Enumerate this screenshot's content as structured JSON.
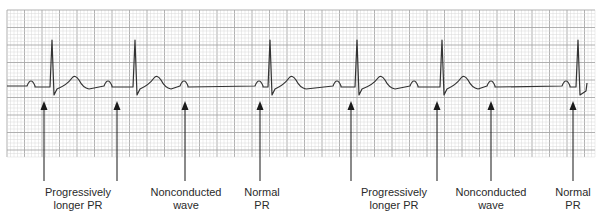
{
  "figure": {
    "type": "ecg-rhythm-strip",
    "grid": {
      "left": 7,
      "top": 10,
      "right": 595,
      "bottom": 157,
      "minor_step": 3.5,
      "major_step": 17.5,
      "minor_color": "#d9d9d9",
      "major_color": "#a8a8a8"
    },
    "trace_color": "#333333",
    "baseline_y": 86,
    "beats": [
      {
        "p_x": 31,
        "qrs_x": 52,
        "t_x": 75,
        "conducted": true
      },
      {
        "p_x": 108,
        "qrs_x": 135,
        "t_x": 157,
        "conducted": true
      },
      {
        "p_x": 184,
        "conducted": false
      },
      {
        "p_x": 259,
        "qrs_x": 270,
        "t_x": 292,
        "conducted": true
      },
      {
        "p_x": 337,
        "qrs_x": 357,
        "t_x": 381,
        "conducted": true
      },
      {
        "p_x": 414,
        "qrs_x": 442,
        "t_x": 464,
        "conducted": true
      },
      {
        "p_x": 491,
        "conducted": false
      },
      {
        "p_x": 566,
        "qrs_x": 578,
        "conducted": true
      }
    ]
  },
  "arrows": [
    {
      "x": 44,
      "label_id": 0
    },
    {
      "x": 117,
      "label_id": 0
    },
    {
      "x": 185,
      "label_id": 1
    },
    {
      "x": 260,
      "label_id": 2
    },
    {
      "x": 351,
      "label_id": 3
    },
    {
      "x": 437,
      "label_id": 3
    },
    {
      "x": 491,
      "label_id": 4
    },
    {
      "x": 573,
      "label_id": 5
    }
  ],
  "labels": [
    {
      "line1": "Progressively",
      "line2": "longer PR",
      "center_x": 78
    },
    {
      "line1": "Nonconducted",
      "line2": "wave",
      "center_x": 186
    },
    {
      "line1": "Normal",
      "line2": "PR",
      "center_x": 262
    },
    {
      "line1": "Progressively",
      "line2": "longer PR",
      "center_x": 394
    },
    {
      "line1": "Nonconducted",
      "line2": "wave",
      "center_x": 491
    },
    {
      "line1": "Normal",
      "line2": "PR",
      "center_x": 573
    }
  ]
}
